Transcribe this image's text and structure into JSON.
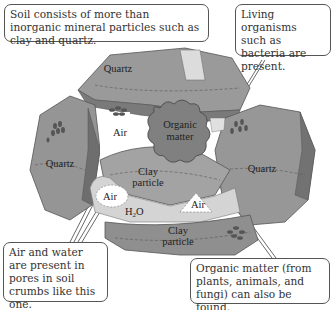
{
  "callouts": {
    "top_left": "Soil consists of more than inorganic mineral particles such as clay and quartz.",
    "top_right": "Living organisms such as bacteria are present.",
    "bottom_left": "Air and water are present in pores in soil crumbs like this one.",
    "bottom_right": "Organic matter (from plants, animals, and fungi) can also be found."
  },
  "labels": {
    "quartz_top": "Quartz",
    "quartz_left": "Quartz",
    "quartz_right": "Quartz",
    "air_center": "Air",
    "organic_1": "Organic",
    "organic_2": "matter",
    "clay_mid_1": "Clay",
    "clay_mid_2": "particle",
    "air_left": "Air",
    "air_right": "Air",
    "water": "H",
    "water_sub": "2",
    "water_o": "O",
    "clay_bottom_1": "Clay",
    "clay_bottom_2": "particle"
  },
  "colors": {
    "particle_fill": "#8a8a8a",
    "particle_light": "#b8b8b8",
    "particle_dark": "#6a6a6a",
    "border": "#555555"
  }
}
